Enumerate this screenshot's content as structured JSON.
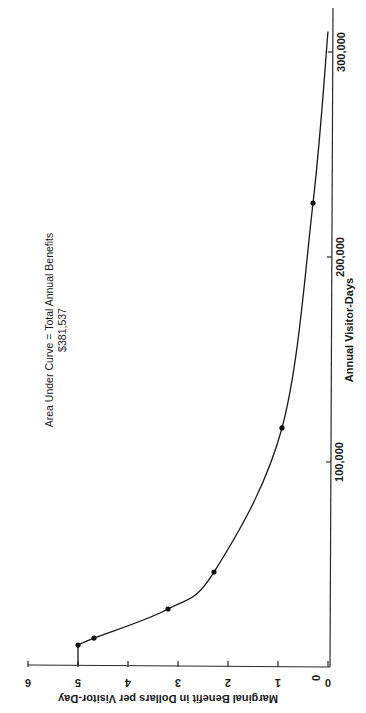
{
  "chart_data": {
    "type": "line",
    "orientation": "rotated-90-ccw",
    "title": "",
    "annotation": {
      "line1": "Area Under Curve = Total Annual Benefits",
      "line2": "$381,537"
    },
    "xlabel": "Annual Visitor-Days",
    "ylabel": "Marginal Benefit in Dollars per Visitor-Day",
    "xlim": [
      0,
      320000
    ],
    "ylim": [
      0,
      6
    ],
    "x_ticks": [
      {
        "value": 0,
        "label": "0"
      },
      {
        "value": 100000,
        "label": "100,000"
      },
      {
        "value": 200000,
        "label": "200,000"
      },
      {
        "value": 300000,
        "label": "300,000"
      }
    ],
    "y_ticks": [
      {
        "value": 0,
        "label": "0"
      },
      {
        "value": 1,
        "label": "1"
      },
      {
        "value": 2,
        "label": "2"
      },
      {
        "value": 3,
        "label": "3"
      },
      {
        "value": 4,
        "label": "4"
      },
      {
        "value": 5,
        "label": "5"
      },
      {
        "value": 6,
        "label": "6"
      }
    ],
    "grid": false,
    "series": [
      {
        "name": "Marginal benefit curve",
        "points": [
          {
            "x": 10700,
            "y": 5.0
          },
          {
            "x": 14100,
            "y": 4.68
          },
          {
            "x": 28300,
            "y": 3.2
          },
          {
            "x": 46300,
            "y": 2.28
          },
          {
            "x": 116600,
            "y": 0.92
          },
          {
            "x": 226300,
            "y": 0.3
          }
        ],
        "curve_start": {
          "x": 10700,
          "y": 5.0,
          "vertical_drop_to": 0
        },
        "curve_end": {
          "x": 310000,
          "y": 0
        }
      }
    ]
  }
}
